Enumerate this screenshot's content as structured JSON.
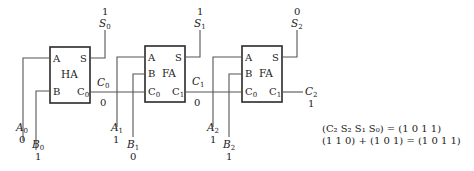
{
  "diagram": {
    "blocks": [
      {
        "id": "ha",
        "label": "HA",
        "ports": {
          "a": "A",
          "b": "B",
          "s": "S",
          "cin": "",
          "cout": "C",
          "cout_sub": "0"
        }
      },
      {
        "id": "fa1",
        "label": "FA",
        "ports": {
          "a": "A",
          "b": "B",
          "s": "S",
          "cin": "C",
          "cin_sub": "0",
          "cout": "C",
          "cout_sub": "1"
        }
      },
      {
        "id": "fa2",
        "label": "FA",
        "ports": {
          "a": "A",
          "b": "B",
          "s": "S",
          "cin": "C",
          "cin_sub": "0",
          "cout": "C",
          "cout_sub": "1"
        }
      }
    ],
    "signals": {
      "a0": {
        "name": "A",
        "sub": "0",
        "value": "0"
      },
      "b0": {
        "name": "B",
        "sub": "0",
        "value": "1"
      },
      "a1": {
        "name": "A",
        "sub": "1",
        "value": "1"
      },
      "b1": {
        "name": "B",
        "sub": "1",
        "value": "0"
      },
      "a2": {
        "name": "A",
        "sub": "2",
        "value": "1"
      },
      "b2": {
        "name": "B",
        "sub": "2",
        "value": "1"
      },
      "s0": {
        "name": "S",
        "sub": "0",
        "value": "1"
      },
      "s1": {
        "name": "S",
        "sub": "1",
        "value": "1"
      },
      "s2": {
        "name": "S",
        "sub": "2",
        "value": "0"
      },
      "c0": {
        "name": "C",
        "sub": "0",
        "value": "0"
      },
      "c1": {
        "name": "C",
        "sub": "1",
        "value": "0"
      },
      "c2": {
        "name": "C",
        "sub": "2",
        "value": "1"
      }
    },
    "equations": {
      "line1": "(C₂ S₂ S₁ S₀) = (1 0 1 1)",
      "line2": "(1 1 0) + (1 0 1) = (1 0 1 1)"
    }
  }
}
